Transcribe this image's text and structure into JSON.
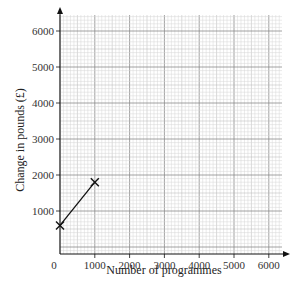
{
  "chart_data": {
    "type": "line",
    "title": "",
    "xlabel": "Number of programmes",
    "ylabel": "Change in pounds (£)",
    "x_ticks": [
      0,
      1000,
      2000,
      3000,
      4000,
      5000,
      6000
    ],
    "x_tick_labels": [
      "0",
      "1000",
      "2000",
      "3000",
      "4000",
      "5000",
      "6000"
    ],
    "y_ticks": [
      1000,
      2000,
      3000,
      4000,
      5000,
      6000
    ],
    "y_tick_labels": [
      "1000",
      "2000",
      "3000",
      "4000",
      "5000",
      "6000"
    ],
    "xlim": [
      0,
      6500
    ],
    "ylim": [
      0,
      6500
    ],
    "grid": true,
    "grid_style": "graph paper (major every 1000, minor every 100)",
    "series": [
      {
        "name": "line",
        "marker": "x",
        "x": [
          0,
          1000
        ],
        "y": [
          600,
          1800
        ]
      }
    ]
  }
}
